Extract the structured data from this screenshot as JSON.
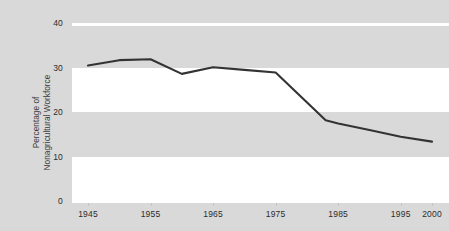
{
  "chart_data": {
    "type": "line",
    "title": "",
    "xlabel": "",
    "ylabel": "Percentage of Nonagricultural Workforce",
    "ylabel_lines": [
      "Percentage of",
      "Nonagricultural Workforce"
    ],
    "xlim": [
      1945,
      2000
    ],
    "ylim": [
      0,
      40
    ],
    "ytick_labels": [
      "40",
      "30",
      "20",
      "10",
      "0"
    ],
    "ytick_values": [
      40,
      30,
      20,
      10,
      0
    ],
    "xtick_labels": [
      "1945",
      "1955",
      "1965",
      "1975",
      "1985",
      "1995",
      "2000"
    ],
    "xtick_values": [
      1945,
      1955,
      1965,
      1975,
      1985,
      1995,
      2000
    ],
    "grid": false,
    "banding": "alternating horizontal gray/white bands every 10 units",
    "legend": "none",
    "series": [
      {
        "name": "Percentage of Nonagricultural Workforce",
        "color": "#333333",
        "x": [
          1945,
          1950,
          1955,
          1960,
          1965,
          1970,
          1975,
          1983,
          1985,
          1990,
          1995,
          2000
        ],
        "values": [
          30.4,
          31.6,
          31.8,
          28.5,
          30.0,
          29.4,
          28.8,
          18.0,
          17.3,
          15.8,
          14.3,
          13.2
        ]
      }
    ],
    "colors": {
      "line": "#333333",
      "band_gray": "#d9d9d9",
      "band_white": "#ffffff",
      "tick_text": "#2b2b2b",
      "axis_title": "#3a3a3a"
    }
  }
}
